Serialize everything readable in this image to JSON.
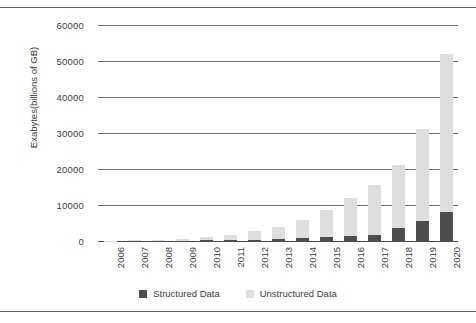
{
  "chart_data": {
    "type": "bar",
    "stacked": true,
    "title": "",
    "xlabel": "",
    "ylabel": "Exabytes(billions of GB)",
    "categories": [
      "2006",
      "2007",
      "2008",
      "2009",
      "2010",
      "2011",
      "2012",
      "2013",
      "2014",
      "2015",
      "2016",
      "2017",
      "2018",
      "2019",
      "2020"
    ],
    "series": [
      {
        "name": "Structured Data",
        "color": "#4d4d4d",
        "values": [
          20,
          40,
          70,
          110,
          170,
          260,
          400,
          600,
          800,
          1000,
          1400,
          1700,
          3500,
          5500,
          8000
        ]
      },
      {
        "name": "Unstructured Data",
        "color": "#dedede",
        "values": [
          60,
          130,
          280,
          480,
          1030,
          1540,
          2300,
          3400,
          5000,
          7500,
          10600,
          13800,
          17500,
          25500,
          44000
        ]
      }
    ],
    "totals": [
      80,
      170,
      350,
      590,
      1200,
      1800,
      2700,
      4000,
      5800,
      8500,
      12000,
      15500,
      21000,
      31000,
      52000
    ],
    "ylim": [
      0,
      60000
    ],
    "yticks": [
      "0",
      "10000",
      "20000",
      "30000",
      "40000",
      "50000",
      "60000"
    ],
    "ytick_values": [
      0,
      10000,
      20000,
      30000,
      40000,
      50000,
      60000
    ],
    "grid": true,
    "legend_position": "bottom"
  },
  "legend": {
    "items": [
      {
        "label": "Structured Data",
        "swatch": "structured"
      },
      {
        "label": "Unstructured Data",
        "swatch": "unstructured"
      }
    ]
  },
  "colors": {
    "structured": "#4d4d4d",
    "unstructured": "#dedede",
    "gridline": "#6f6f6f",
    "rule": "#5e5e5e",
    "text": "#3b3b3b"
  }
}
